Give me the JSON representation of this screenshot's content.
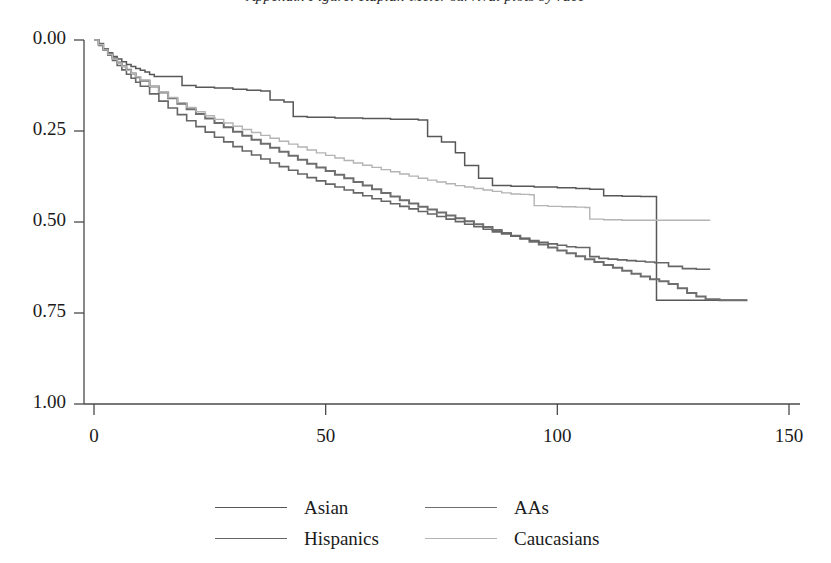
{
  "figure": {
    "title_fragment": "Appendix Figure: Kaplan-Meier survival plots by race",
    "background": "#ffffff"
  },
  "axes": {
    "x_ticks": [
      "0",
      "50",
      "100",
      "150"
    ],
    "y_ticks": [
      "1.00",
      "0.75",
      "0.50",
      "0.25",
      "0.00"
    ],
    "xlabel": "",
    "ylabel": ""
  },
  "legend": {
    "rows": [
      [
        {
          "label": "Asian",
          "color": "#575757"
        },
        {
          "label": "AAs",
          "color": "#6e6e6e"
        }
      ],
      [
        {
          "label": "Hispanics",
          "color": "#666666"
        },
        {
          "label": "Caucasians",
          "color": "#b4b4b4"
        }
      ]
    ]
  },
  "chart_data": {
    "type": "line",
    "title": "Kaplan-Meier survival plots by race",
    "xlabel": "",
    "ylabel": "",
    "xlim": [
      0,
      150
    ],
    "ylim": [
      0,
      1.0
    ],
    "grid": false,
    "legend_position": "bottom",
    "step_style": "post",
    "x_tick_values": [
      0,
      50,
      100,
      150
    ],
    "y_tick_values": [
      0.0,
      0.25,
      0.5,
      0.75,
      1.0
    ],
    "series": [
      {
        "name": "Asian",
        "color": "#575757",
        "width": 1.5,
        "points": [
          [
            0,
            1.0
          ],
          [
            1,
            0.985
          ],
          [
            2,
            0.975
          ],
          [
            3,
            0.965
          ],
          [
            4,
            0.955
          ],
          [
            5,
            0.948
          ],
          [
            6,
            0.94
          ],
          [
            7,
            0.933
          ],
          [
            8,
            0.927
          ],
          [
            9,
            0.922
          ],
          [
            10,
            0.917
          ],
          [
            11,
            0.912
          ],
          [
            12,
            0.905
          ],
          [
            13,
            0.9
          ],
          [
            14,
            0.9
          ],
          [
            18,
            0.9
          ],
          [
            19,
            0.875
          ],
          [
            22,
            0.87
          ],
          [
            26,
            0.868
          ],
          [
            30,
            0.865
          ],
          [
            33,
            0.862
          ],
          [
            36,
            0.86
          ],
          [
            38,
            0.835
          ],
          [
            41,
            0.83
          ],
          [
            43,
            0.79
          ],
          [
            46,
            0.788
          ],
          [
            52,
            0.786
          ],
          [
            58,
            0.784
          ],
          [
            64,
            0.782
          ],
          [
            70,
            0.78
          ],
          [
            72,
            0.735
          ],
          [
            75,
            0.72
          ],
          [
            78,
            0.69
          ],
          [
            80,
            0.655
          ],
          [
            83,
            0.62
          ],
          [
            86,
            0.6
          ],
          [
            90,
            0.598
          ],
          [
            95,
            0.596
          ],
          [
            100,
            0.594
          ],
          [
            104,
            0.592
          ],
          [
            107,
            0.59
          ],
          [
            110,
            0.572
          ],
          [
            114,
            0.571
          ],
          [
            118,
            0.57
          ],
          [
            121,
            0.57
          ],
          [
            121.4,
            0.285
          ],
          [
            126,
            0.285
          ],
          [
            132,
            0.285
          ],
          [
            138,
            0.285
          ],
          [
            141,
            0.285
          ]
        ]
      },
      {
        "name": "AAs",
        "color": "#6e6e6e",
        "width": 2.0,
        "points": [
          [
            0,
            1.0
          ],
          [
            1,
            0.99
          ],
          [
            2,
            0.975
          ],
          [
            3,
            0.962
          ],
          [
            4,
            0.95
          ],
          [
            5,
            0.938
          ],
          [
            6,
            0.928
          ],
          [
            7,
            0.918
          ],
          [
            8,
            0.908
          ],
          [
            9,
            0.898
          ],
          [
            10,
            0.888
          ],
          [
            12,
            0.872
          ],
          [
            14,
            0.856
          ],
          [
            16,
            0.84
          ],
          [
            18,
            0.825
          ],
          [
            20,
            0.81
          ],
          [
            22,
            0.797
          ],
          [
            24,
            0.784
          ],
          [
            26,
            0.772
          ],
          [
            28,
            0.76
          ],
          [
            30,
            0.748
          ],
          [
            32,
            0.737
          ],
          [
            34,
            0.726
          ],
          [
            36,
            0.715
          ],
          [
            38,
            0.704
          ],
          [
            40,
            0.693
          ],
          [
            42,
            0.682
          ],
          [
            44,
            0.671
          ],
          [
            46,
            0.66
          ],
          [
            48,
            0.65
          ],
          [
            50,
            0.64
          ],
          [
            52,
            0.63
          ],
          [
            54,
            0.62
          ],
          [
            56,
            0.61
          ],
          [
            58,
            0.6
          ],
          [
            60,
            0.59
          ],
          [
            62,
            0.58
          ],
          [
            64,
            0.57
          ],
          [
            66,
            0.56
          ],
          [
            68,
            0.551
          ],
          [
            70,
            0.542
          ],
          [
            72,
            0.534
          ],
          [
            74,
            0.526
          ],
          [
            76,
            0.518
          ],
          [
            78,
            0.51
          ],
          [
            80,
            0.502
          ],
          [
            82,
            0.494
          ],
          [
            84,
            0.486
          ],
          [
            86,
            0.478
          ],
          [
            88,
            0.47
          ],
          [
            90,
            0.462
          ],
          [
            92,
            0.454
          ],
          [
            94,
            0.446
          ],
          [
            96,
            0.438
          ],
          [
            98,
            0.43
          ],
          [
            100,
            0.422
          ],
          [
            102,
            0.414
          ],
          [
            104,
            0.406
          ],
          [
            106,
            0.398
          ],
          [
            108,
            0.39
          ],
          [
            110,
            0.382
          ],
          [
            112,
            0.374
          ],
          [
            114,
            0.366
          ],
          [
            116,
            0.358
          ],
          [
            118,
            0.35
          ],
          [
            120,
            0.343
          ],
          [
            122,
            0.337
          ],
          [
            124,
            0.33
          ],
          [
            126,
            0.318
          ],
          [
            128,
            0.305
          ],
          [
            130,
            0.295
          ],
          [
            132,
            0.288
          ],
          [
            135,
            0.285
          ],
          [
            138,
            0.285
          ],
          [
            141,
            0.285
          ]
        ]
      },
      {
        "name": "Hispanics",
        "color": "#666666",
        "width": 1.6,
        "points": [
          [
            0,
            1.0
          ],
          [
            1,
            0.988
          ],
          [
            2,
            0.972
          ],
          [
            3,
            0.958
          ],
          [
            4,
            0.944
          ],
          [
            5,
            0.93
          ],
          [
            6,
            0.918
          ],
          [
            7,
            0.906
          ],
          [
            8,
            0.895
          ],
          [
            9,
            0.884
          ],
          [
            10,
            0.873
          ],
          [
            12,
            0.852
          ],
          [
            14,
            0.832
          ],
          [
            16,
            0.813
          ],
          [
            18,
            0.795
          ],
          [
            20,
            0.778
          ],
          [
            22,
            0.762
          ],
          [
            24,
            0.747
          ],
          [
            26,
            0.733
          ],
          [
            28,
            0.72
          ],
          [
            30,
            0.707
          ],
          [
            32,
            0.695
          ],
          [
            34,
            0.684
          ],
          [
            36,
            0.673
          ],
          [
            38,
            0.662
          ],
          [
            40,
            0.652
          ],
          [
            42,
            0.642
          ],
          [
            44,
            0.632
          ],
          [
            46,
            0.622
          ],
          [
            48,
            0.613
          ],
          [
            50,
            0.604
          ],
          [
            52,
            0.596
          ],
          [
            54,
            0.588
          ],
          [
            56,
            0.58
          ],
          [
            58,
            0.572
          ],
          [
            60,
            0.564
          ],
          [
            62,
            0.557
          ],
          [
            64,
            0.55
          ],
          [
            66,
            0.543
          ],
          [
            68,
            0.536
          ],
          [
            70,
            0.529
          ],
          [
            72,
            0.522
          ],
          [
            74,
            0.515
          ],
          [
            76,
            0.508
          ],
          [
            78,
            0.501
          ],
          [
            80,
            0.494
          ],
          [
            82,
            0.487
          ],
          [
            84,
            0.48
          ],
          [
            86,
            0.473
          ],
          [
            88,
            0.467
          ],
          [
            90,
            0.461
          ],
          [
            92,
            0.455
          ],
          [
            94,
            0.449
          ],
          [
            96,
            0.444
          ],
          [
            98,
            0.44
          ],
          [
            100,
            0.436
          ],
          [
            102,
            0.432
          ],
          [
            104,
            0.43
          ],
          [
            106,
            0.43
          ],
          [
            107,
            0.405
          ],
          [
            109,
            0.4
          ],
          [
            111,
            0.398
          ],
          [
            113,
            0.396
          ],
          [
            115,
            0.394
          ],
          [
            117,
            0.392
          ],
          [
            119,
            0.39
          ],
          [
            121,
            0.388
          ],
          [
            124,
            0.378
          ],
          [
            127,
            0.372
          ],
          [
            130,
            0.37
          ],
          [
            133,
            0.37
          ]
        ]
      },
      {
        "name": "Caucasians",
        "color": "#b4b4b4",
        "width": 1.4,
        "points": [
          [
            0,
            1.0
          ],
          [
            1,
            0.987
          ],
          [
            2,
            0.973
          ],
          [
            3,
            0.96
          ],
          [
            4,
            0.948
          ],
          [
            5,
            0.937
          ],
          [
            6,
            0.927
          ],
          [
            7,
            0.917
          ],
          [
            8,
            0.908
          ],
          [
            9,
            0.899
          ],
          [
            10,
            0.89
          ],
          [
            12,
            0.873
          ],
          [
            14,
            0.857
          ],
          [
            16,
            0.842
          ],
          [
            18,
            0.828
          ],
          [
            20,
            0.815
          ],
          [
            22,
            0.803
          ],
          [
            24,
            0.792
          ],
          [
            26,
            0.782
          ],
          [
            28,
            0.772
          ],
          [
            30,
            0.763
          ],
          [
            32,
            0.754
          ],
          [
            34,
            0.746
          ],
          [
            36,
            0.738
          ],
          [
            38,
            0.73
          ],
          [
            40,
            0.722
          ],
          [
            42,
            0.714
          ],
          [
            44,
            0.706
          ],
          [
            46,
            0.698
          ],
          [
            48,
            0.69
          ],
          [
            50,
            0.683
          ],
          [
            52,
            0.676
          ],
          [
            54,
            0.669
          ],
          [
            56,
            0.662
          ],
          [
            58,
            0.656
          ],
          [
            60,
            0.65
          ],
          [
            62,
            0.644
          ],
          [
            64,
            0.638
          ],
          [
            66,
            0.632
          ],
          [
            68,
            0.626
          ],
          [
            70,
            0.62
          ],
          [
            72,
            0.615
          ],
          [
            74,
            0.61
          ],
          [
            76,
            0.605
          ],
          [
            78,
            0.6
          ],
          [
            80,
            0.596
          ],
          [
            82,
            0.592
          ],
          [
            84,
            0.588
          ],
          [
            86,
            0.584
          ],
          [
            88,
            0.58
          ],
          [
            90,
            0.577
          ],
          [
            92,
            0.576
          ],
          [
            94,
            0.575
          ],
          [
            95,
            0.545
          ],
          [
            98,
            0.543
          ],
          [
            101,
            0.542
          ],
          [
            104,
            0.541
          ],
          [
            106,
            0.54
          ],
          [
            107,
            0.508
          ],
          [
            110,
            0.506
          ],
          [
            114,
            0.505
          ],
          [
            118,
            0.505
          ],
          [
            122,
            0.505
          ],
          [
            126,
            0.505
          ],
          [
            130,
            0.505
          ],
          [
            133,
            0.505
          ]
        ]
      }
    ]
  }
}
